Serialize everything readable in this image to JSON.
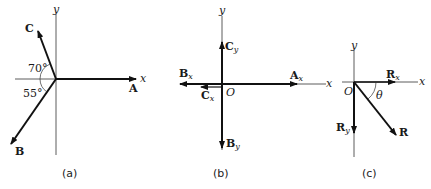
{
  "figure": {
    "panels": [
      {
        "id": "a",
        "caption": "(a)",
        "axes": {
          "x_label": "x",
          "y_label": "y"
        },
        "vectors": [
          {
            "name": "A",
            "direction": "along +x"
          },
          {
            "name": "B",
            "angle_label": "55°",
            "description": "below -x axis"
          },
          {
            "name": "C",
            "angle_label": "70°",
            "description": "above -x axis"
          }
        ],
        "angles": [
          "70°",
          "55°"
        ]
      },
      {
        "id": "b",
        "caption": "(b)",
        "axes": {
          "x_label": "x",
          "y_label": "y",
          "origin_label": "O"
        },
        "components": [
          {
            "name": "A",
            "sub": "x",
            "direction": "+x"
          },
          {
            "name": "B",
            "sub": "x",
            "direction": "-x"
          },
          {
            "name": "C",
            "sub": "x",
            "direction": "-x (short)"
          },
          {
            "name": "C",
            "sub": "y",
            "direction": "+y"
          },
          {
            "name": "B",
            "sub": "y",
            "direction": "-y"
          }
        ]
      },
      {
        "id": "c",
        "caption": "(c)",
        "axes": {
          "x_label": "x",
          "y_label": "y",
          "origin_label": "O"
        },
        "vectors": [
          {
            "name": "R",
            "sub": "x",
            "direction": "+x"
          },
          {
            "name": "R",
            "sub": "y",
            "direction": "-y"
          },
          {
            "name": "R",
            "sub": "",
            "direction": "fourth quadrant"
          }
        ],
        "angle_label": "θ"
      }
    ]
  }
}
